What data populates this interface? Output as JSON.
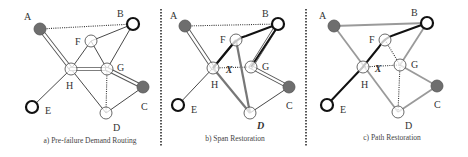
{
  "colors": {
    "background": "#ffffff",
    "filled_node": "#6e6e6e",
    "thin_edge": "#333333",
    "route_dark": "#111111",
    "route_gray": "#9a9a9a",
    "divider": "#555555"
  },
  "dividers": [
    {
      "x": 161,
      "y1": 9,
      "y2": 146
    },
    {
      "x": 306,
      "y1": 9,
      "y2": 146
    }
  ],
  "panels": [
    {
      "id": "a",
      "caption": "a) Pre-failure Demand Routing",
      "caption_pos": [
        90,
        143
      ],
      "nodes": [
        {
          "id": "A",
          "x": 40,
          "y": 29,
          "r": 6,
          "style": "filled",
          "label": "A",
          "lx": 24,
          "ly": 20
        },
        {
          "id": "B",
          "x": 133,
          "y": 24,
          "r": 6,
          "style": "bold",
          "label": "B",
          "lx": 117,
          "ly": 17
        },
        {
          "id": "F",
          "x": 91,
          "y": 41,
          "r": 6,
          "style": "plain",
          "label": "F",
          "lx": 75,
          "ly": 45
        },
        {
          "id": "G",
          "x": 107,
          "y": 69,
          "r": 6,
          "style": "plain",
          "label": "G",
          "lx": 117,
          "ly": 71
        },
        {
          "id": "H",
          "x": 71,
          "y": 69,
          "r": 6,
          "style": "plain",
          "label": "H",
          "lx": 66,
          "ly": 89
        },
        {
          "id": "C",
          "x": 143,
          "y": 87,
          "r": 6,
          "style": "filled",
          "label": "C",
          "lx": 141,
          "ly": 110
        },
        {
          "id": "E",
          "x": 32,
          "y": 107,
          "r": 6,
          "style": "bold",
          "label": "E",
          "lx": 45,
          "ly": 114
        },
        {
          "id": "D",
          "x": 106,
          "y": 113,
          "r": 6,
          "style": "plain",
          "label": "D",
          "lx": 113,
          "ly": 131
        }
      ],
      "edges": [
        {
          "from": "A",
          "to": "B",
          "style": "dotted"
        },
        {
          "from": "F",
          "to": "B",
          "style": "thin"
        },
        {
          "from": "G",
          "to": "B",
          "style": "thin"
        },
        {
          "from": "F",
          "to": "H",
          "style": "thin"
        },
        {
          "from": "F",
          "to": "G",
          "style": "thin"
        },
        {
          "from": "H",
          "to": "E",
          "style": "thin"
        },
        {
          "from": "H",
          "to": "D",
          "style": "thin"
        },
        {
          "from": "G",
          "to": "D",
          "style": "dotted"
        },
        {
          "from": "D",
          "to": "C",
          "style": "thin"
        },
        {
          "from": "A",
          "to": "H",
          "style": "double"
        },
        {
          "from": "H",
          "to": "G",
          "style": "double"
        },
        {
          "from": "G",
          "to": "C",
          "style": "double"
        }
      ],
      "marks": []
    },
    {
      "id": "b",
      "caption": "b) Span Restoration",
      "caption_pos": [
        235,
        141
      ],
      "nodes": [
        {
          "id": "A",
          "x": 185,
          "y": 26,
          "r": 6,
          "style": "filled",
          "label": "A",
          "lx": 170,
          "ly": 19
        },
        {
          "id": "B",
          "x": 278,
          "y": 24,
          "r": 6,
          "style": "bold",
          "label": "B",
          "lx": 262,
          "ly": 17
        },
        {
          "id": "F",
          "x": 236,
          "y": 40,
          "r": 6,
          "style": "plain",
          "label": "F",
          "lx": 220,
          "ly": 43
        },
        {
          "id": "G",
          "x": 251,
          "y": 67,
          "r": 6,
          "style": "plain",
          "label": "G",
          "lx": 262,
          "ly": 70
        },
        {
          "id": "H",
          "x": 213,
          "y": 68,
          "r": 6,
          "style": "plain",
          "label": "H",
          "lx": 211,
          "ly": 88
        },
        {
          "id": "C",
          "x": 289,
          "y": 87,
          "r": 6,
          "style": "filled",
          "label": "C",
          "lx": 286,
          "ly": 109
        },
        {
          "id": "E",
          "x": 178,
          "y": 105,
          "r": 6,
          "style": "bold",
          "label": "E",
          "lx": 191,
          "ly": 113
        },
        {
          "id": "D",
          "x": 250,
          "y": 113,
          "r": 6,
          "style": "plain",
          "label": "D",
          "lx": 257,
          "ly": 129,
          "italic": true
        }
      ],
      "edges": [
        {
          "from": "A",
          "to": "B",
          "style": "dotted"
        },
        {
          "from": "H",
          "to": "E",
          "style": "thin"
        },
        {
          "from": "D",
          "to": "C",
          "style": "thin"
        },
        {
          "from": "H",
          "to": "G",
          "style": "dotted"
        },
        {
          "from": "A",
          "to": "H",
          "style": "double"
        },
        {
          "from": "G",
          "to": "C",
          "style": "double"
        },
        {
          "from": "G",
          "to": "B",
          "style": "double"
        },
        {
          "from": "H",
          "to": "D",
          "style": "gray-thick"
        },
        {
          "from": "D",
          "to": "F",
          "style": "gray-thick"
        },
        {
          "from": "F",
          "to": "H",
          "style": "gray-thick"
        }
      ],
      "paths": [
        {
          "d": "M213,68 L232,45 Q238,38 246,36 L278,24",
          "style": "dark"
        },
        {
          "d": "M251,67 L278,26",
          "style": "dark"
        }
      ],
      "marks": [
        {
          "text": "X",
          "x": 229,
          "y": 73
        }
      ]
    },
    {
      "id": "c",
      "caption": "c) Path Restoration",
      "caption_pos": [
        392,
        140
      ],
      "nodes": [
        {
          "id": "A",
          "x": 334,
          "y": 26,
          "r": 6,
          "style": "filled",
          "label": "A",
          "lx": 319,
          "ly": 19
        },
        {
          "id": "B",
          "x": 427,
          "y": 23,
          "r": 6,
          "style": "bold",
          "label": "B",
          "lx": 411,
          "ly": 16
        },
        {
          "id": "F",
          "x": 385,
          "y": 40,
          "r": 6,
          "style": "plain",
          "label": "F",
          "lx": 369,
          "ly": 43
        },
        {
          "id": "G",
          "x": 400,
          "y": 65,
          "r": 6,
          "style": "plain",
          "label": "G",
          "lx": 411,
          "ly": 68
        },
        {
          "id": "H",
          "x": 363,
          "y": 67,
          "r": 6,
          "style": "plain",
          "label": "H",
          "lx": 361,
          "ly": 88
        },
        {
          "id": "C",
          "x": 437,
          "y": 86,
          "r": 6,
          "style": "filled",
          "label": "C",
          "lx": 434,
          "ly": 108
        },
        {
          "id": "E",
          "x": 327,
          "y": 105,
          "r": 6,
          "style": "bold",
          "label": "E",
          "lx": 340,
          "ly": 113
        },
        {
          "id": "D",
          "x": 398,
          "y": 112,
          "r": 6,
          "style": "plain",
          "label": "D",
          "lx": 405,
          "ly": 129
        }
      ],
      "edges": [
        {
          "from": "A",
          "to": "B",
          "style": "gray"
        },
        {
          "from": "A",
          "to": "D",
          "style": "gray"
        },
        {
          "from": "G",
          "to": "B",
          "style": "gray"
        },
        {
          "from": "G",
          "to": "C",
          "style": "gray"
        },
        {
          "from": "D",
          "to": "C",
          "style": "gray"
        },
        {
          "from": "F",
          "to": "G",
          "style": "dotted"
        },
        {
          "from": "H",
          "to": "G",
          "style": "dotted"
        },
        {
          "from": "G",
          "to": "D",
          "style": "dotted"
        }
      ],
      "paths": [
        {
          "d": "M327,105 L362,68 L379,47 Q384,38 394,35 L427,23",
          "style": "dark"
        }
      ],
      "marks": [
        {
          "text": "X",
          "x": 378,
          "y": 72
        }
      ]
    }
  ]
}
